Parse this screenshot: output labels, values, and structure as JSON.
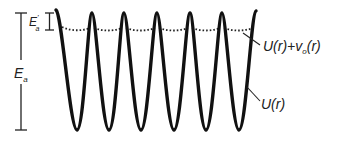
{
  "diagram": {
    "type": "periodic-potential",
    "colors": {
      "curve": "#111111",
      "dotted": "#222222",
      "text": "#222222"
    },
    "labels": {
      "E_a_main": "E",
      "E_a_main_sub": "a",
      "E_a_prime": "E",
      "E_a_prime_sup": "'",
      "E_a_prime_sub": "a",
      "curve_dotted": "U(r)+v",
      "curve_dotted_sub": "o",
      "curve_dotted_tail": "(r)",
      "curve_solid": "U(r)"
    },
    "geometry": {
      "peak_y": 13,
      "trough_y": 130,
      "dotted_y": 30,
      "peaks_x": [
        60,
        92,
        124,
        157,
        190,
        222,
        255
      ],
      "troughs_x": [
        77,
        109,
        141,
        174,
        206,
        239
      ]
    }
  }
}
